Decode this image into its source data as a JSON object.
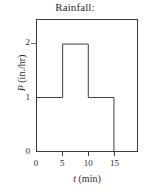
{
  "chart_data": {
    "type": "bar",
    "title": "Rainfall:",
    "xlabel_symbol": "t",
    "xlabel_units": "(min)",
    "ylabel_symbol": "P",
    "ylabel_units": "(in./hr)",
    "xlabel": "t (min)",
    "ylabel": "P (in./hr)",
    "xlim": [
      0,
      19.5
    ],
    "ylim": [
      0,
      2.45
    ],
    "grid": false,
    "legend": false,
    "x_ticks": [
      0,
      5,
      10,
      15
    ],
    "x_tick_labels": [
      "0",
      "5",
      "10",
      "15"
    ],
    "y_ticks": [
      0,
      1,
      2
    ],
    "y_tick_labels": [
      "0",
      "1",
      "2"
    ],
    "categories": [
      "0-5",
      "5-10",
      "10-15"
    ],
    "bin_edges": [
      0,
      5,
      10,
      15
    ],
    "values": [
      1,
      2,
      1
    ],
    "series": [
      {
        "name": "P (in./hr)",
        "values": [
          1,
          2,
          1
        ]
      }
    ],
    "line_color": "#3a3a3a",
    "background_color": "#ffffff"
  },
  "figure": {
    "title": "Rainfall:"
  }
}
